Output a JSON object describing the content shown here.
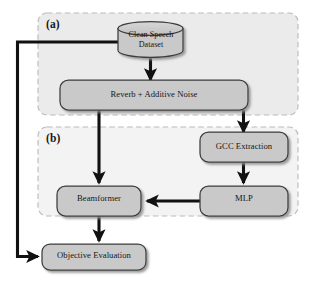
{
  "figure": {
    "kind": "block-diagram",
    "groups": [
      {
        "id": "a",
        "label": "(a)",
        "fill": "#ebebeb",
        "border": "#b9b9b9"
      },
      {
        "id": "b",
        "label": "(b)",
        "fill": "#f3f3f3",
        "border": "#b9b9b9"
      }
    ],
    "nodes": [
      {
        "id": "clean_speech_dataset",
        "label": "Clean Speech\nDataset",
        "shape": "cylinder",
        "group": "a"
      },
      {
        "id": "reverb_additive_noise",
        "label": "Reverb + Additive Noise",
        "shape": "rounded-rect",
        "group": "a"
      },
      {
        "id": "gcc_extraction",
        "label": "GCC Extraction",
        "shape": "rounded-rect",
        "group": "b"
      },
      {
        "id": "beamformer",
        "label": "Beamformer",
        "shape": "rounded-rect",
        "group": "b"
      },
      {
        "id": "mlp",
        "label": "MLP",
        "shape": "rounded-rect",
        "group": "b"
      },
      {
        "id": "objective_evaluation",
        "label": "Objective Evaluation",
        "shape": "rounded-rect",
        "group": "none"
      }
    ],
    "edges": [
      {
        "from": "clean_speech_dataset",
        "to": "reverb_additive_noise"
      },
      {
        "from": "clean_speech_dataset",
        "to": "objective_evaluation"
      },
      {
        "from": "reverb_additive_noise",
        "to": "beamformer"
      },
      {
        "from": "reverb_additive_noise",
        "to": "gcc_extraction"
      },
      {
        "from": "gcc_extraction",
        "to": "mlp"
      },
      {
        "from": "mlp",
        "to": "beamformer"
      },
      {
        "from": "beamformer",
        "to": "objective_evaluation"
      }
    ],
    "colors": {
      "node_fill": "#c9c9c9",
      "node_stroke": "#3c3c3c",
      "arrow": "#111111",
      "text": "#161616",
      "page_background": "#ffffff"
    }
  },
  "labels": {
    "group_a": "(a)",
    "group_b": "(b)",
    "clean_speech_line1": "Clean Speech",
    "clean_speech_line2": "Dataset",
    "reverb": "Reverb + Additive Noise",
    "gcc": "GCC Extraction",
    "beamformer": "Beamformer",
    "mlp": "MLP",
    "objective": "Objective Evaluation"
  }
}
